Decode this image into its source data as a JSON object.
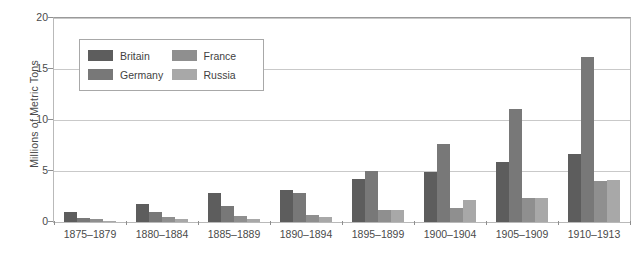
{
  "chart_data": {
    "type": "bar",
    "title": "",
    "subtitle": "",
    "xlabel": "",
    "ylabel": "Millions of Metric Tons",
    "ylim": [
      0,
      20
    ],
    "yticks": [
      0,
      5,
      10,
      15,
      20
    ],
    "ytick_labels": [
      "0",
      "5",
      "10",
      "15",
      "20"
    ],
    "grid": true,
    "legend_position": "inside-upper-left",
    "categories": [
      "1875–1879",
      "1880–1884",
      "1885–1889",
      "1890–1894",
      "1895–1899",
      "1900–1904",
      "1905–1909",
      "1910–1913"
    ],
    "series": [
      {
        "name": "Britain",
        "color": "#5d5d5d",
        "values": [
          1.0,
          1.8,
          2.8,
          3.1,
          4.2,
          4.9,
          5.9,
          6.7
        ]
      },
      {
        "name": "Germany",
        "color": "#787878",
        "values": [
          0.4,
          1.0,
          1.6,
          2.8,
          5.0,
          7.6,
          11.1,
          16.2
        ]
      },
      {
        "name": "France",
        "color": "#8f8f8f",
        "values": [
          0.3,
          0.5,
          0.6,
          0.7,
          1.2,
          1.4,
          2.4,
          4.0
        ]
      },
      {
        "name": "Russia",
        "color": "#a8a8a8",
        "values": [
          0.1,
          0.3,
          0.3,
          0.5,
          1.2,
          2.2,
          2.4,
          4.1
        ]
      }
    ]
  },
  "legend": {
    "items": [
      {
        "label": "Britain",
        "color": "#5d5d5d"
      },
      {
        "label": "France",
        "color": "#8f8f8f"
      },
      {
        "label": "Germany",
        "color": "#787878"
      },
      {
        "label": "Russia",
        "color": "#a8a8a8"
      }
    ]
  },
  "axis": {
    "y_title": "Millions of Metric Tons"
  },
  "colors": {
    "gridline": "#c9c9c9",
    "frame": "#b9b9b9",
    "text": "#4a4a4a",
    "background": "#ffffff"
  }
}
